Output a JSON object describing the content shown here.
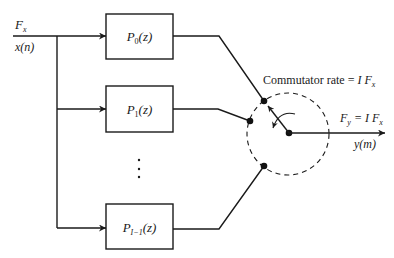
{
  "diagram": {
    "input": {
      "rate_label": {
        "main": "F",
        "sub": "x"
      },
      "signal_label": "x(n)"
    },
    "filters": [
      {
        "name": "P",
        "sub": "0",
        "arg": "(z)"
      },
      {
        "name": "P",
        "sub": "1",
        "arg": "(z)"
      },
      {
        "name": "P",
        "sub": "I−1",
        "arg": "(z)"
      }
    ],
    "ellipsis": "⋮",
    "commutator": {
      "label": {
        "prefix": "Commutator rate = ",
        "factor": "I F",
        "sub": "x"
      }
    },
    "output": {
      "rate_label": {
        "main": "F",
        "sub": "y",
        "eq": " = I F",
        "sub2": "x"
      },
      "signal_label": "y(m)"
    },
    "colors": {
      "line": "#1a1a1a",
      "background": "#ffffff"
    }
  }
}
